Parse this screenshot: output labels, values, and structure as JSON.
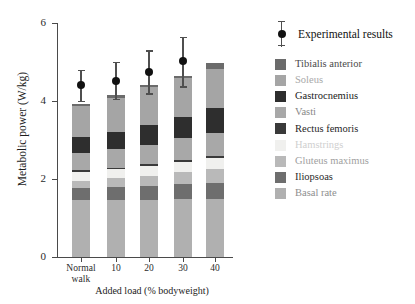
{
  "chart_data": {
    "type": "bar",
    "stacked": true,
    "title": "",
    "xlabel": "Added load (% bodyweight)",
    "ylabel": "Metabolic power (W/kg)",
    "categories": [
      "Normal walk",
      "10",
      "20",
      "30",
      "40"
    ],
    "category_labels_multiline": [
      [
        "Normal",
        "walk"
      ],
      [
        "10"
      ],
      [
        "20"
      ],
      [
        "30"
      ],
      [
        "40"
      ]
    ],
    "ylim": [
      0,
      6
    ],
    "yticks": [
      0,
      2,
      4,
      6
    ],
    "ytick_labels": [
      "0",
      "2",
      "4",
      "6"
    ],
    "grid": false,
    "legend_position": "right",
    "series": [
      {
        "name": "Basal rate",
        "color": "#b0b0b0",
        "values": [
          1.47,
          1.47,
          1.47,
          1.5,
          1.5
        ]
      },
      {
        "name": "Iliopsoas",
        "color": "#6e6e6e",
        "values": [
          0.29,
          0.32,
          0.34,
          0.37,
          0.4
        ]
      },
      {
        "name": "Gluteus maximus",
        "color": "#b9b9b9",
        "values": [
          0.2,
          0.23,
          0.27,
          0.31,
          0.35
        ]
      },
      {
        "name": "Hamstrings",
        "color": "#f0f0ee",
        "values": [
          0.22,
          0.23,
          0.25,
          0.26,
          0.28
        ]
      },
      {
        "name": "Rectus femoris",
        "color": "#3a3a3a",
        "values": [
          0.04,
          0.04,
          0.05,
          0.05,
          0.06
        ]
      },
      {
        "name": "Vasti",
        "color": "#a8a8a8",
        "values": [
          0.45,
          0.47,
          0.5,
          0.55,
          0.6
        ]
      },
      {
        "name": "Gastrocnemius",
        "color": "#2e2e2e",
        "values": [
          0.4,
          0.45,
          0.5,
          0.56,
          0.62
        ]
      },
      {
        "name": "Soleus",
        "color": "#a5a5a5",
        "values": [
          0.8,
          0.88,
          0.98,
          1.0,
          1.0
        ]
      },
      {
        "name": "Tibialis anterior",
        "color": "#6b6b6b",
        "values": [
          0.06,
          0.06,
          0.04,
          0.03,
          0.16
        ]
      }
    ],
    "totals": [
      3.93,
      4.15,
      4.4,
      4.63,
      4.97
    ],
    "experimental": {
      "name": "Experimental results",
      "marker": "filled-circle",
      "values": [
        4.4,
        4.52,
        4.75,
        5.03,
        5.03
      ],
      "err_low": [
        4.0,
        4.05,
        4.2,
        4.38,
        4.38
      ],
      "err_high": [
        4.8,
        5.0,
        5.3,
        5.65,
        5.65
      ],
      "n_points": 4
    }
  },
  "legend": {
    "header": {
      "label": "Experimental results",
      "marker_icon": "errorbar-dot-icon"
    },
    "items": [
      {
        "label": "Tibialis anterior",
        "color": "#6b6b6b",
        "text_color": "#4a4a4a"
      },
      {
        "label": "Soleus",
        "color": "#a5a5a5",
        "text_color": "#a9a9a9"
      },
      {
        "label": "Gastrocnemius",
        "color": "#2e2e2e",
        "text_color": "#1a1a1a"
      },
      {
        "label": "Vasti",
        "color": "#a8a8a8",
        "text_color": "#888888"
      },
      {
        "label": "Rectus femoris",
        "color": "#3a3a3a",
        "text_color": "#1f1f1f"
      },
      {
        "label": "Hamstrings",
        "color": "#f0f0ee",
        "text_color": "#cfcfcf"
      },
      {
        "label": "Gluteus maximus",
        "color": "#b9b9b9",
        "text_color": "#a0a0a0"
      },
      {
        "label": "Iliopsoas",
        "color": "#6e6e6e",
        "text_color": "#2b2b2b"
      },
      {
        "label": "Basal rate",
        "color": "#b0b0b0",
        "text_color": "#8e8e8e"
      }
    ]
  },
  "colors": {
    "axis": "#4a4a4a",
    "text": "#1d1d1d",
    "background": "#ffffff",
    "marker": "#111111",
    "errorbar": "#4f4f4f"
  }
}
